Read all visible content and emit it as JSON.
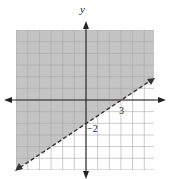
{
  "chart_data": {
    "type": "line",
    "title": "",
    "xlabel": "",
    "ylabel": "y",
    "xlim": [
      -6,
      6
    ],
    "ylim": [
      -6,
      6
    ],
    "grid": true,
    "grid_step": 1,
    "series": [
      {
        "name": "boundary",
        "equation": "y = (2/3)x - 2",
        "style": "dashed",
        "x": [
          -6,
          3,
          5.7
        ],
        "y": [
          -6,
          0,
          1.8
        ]
      }
    ],
    "shaded_region": "above line (y > (2/3)x - 2)",
    "annotations": [
      {
        "text": "3",
        "x": 3,
        "y": 0,
        "meaning": "x-intercept"
      },
      {
        "text": "−2",
        "x": 0,
        "y": -2,
        "meaning": "y-intercept"
      }
    ],
    "colors": {
      "shade": "#c4c4c4",
      "grid": "#a8a8a8",
      "axis": "#222222",
      "line": "#333333"
    }
  },
  "labels": {
    "y_axis": "y",
    "x_intercept": "3",
    "y_intercept": "−2"
  }
}
